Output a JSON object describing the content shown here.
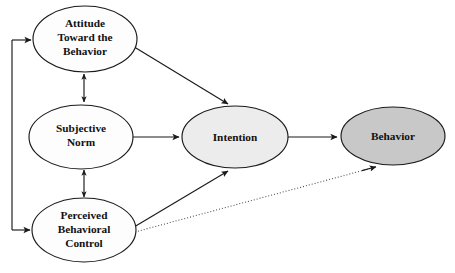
{
  "diagram": {
    "type": "path-diagram",
    "background_color": "#ffffff",
    "stroke_color": "#1a1a1a",
    "nodes": [
      {
        "id": "attitude",
        "label_lines": [
          "Attitude",
          "Toward the",
          "Behavior"
        ],
        "line1": "Attitude",
        "line2": "Toward the",
        "line3": "Behavior",
        "cx": 85,
        "cy": 39,
        "rx": 52,
        "ry": 33,
        "fill": "#fdfdfd"
      },
      {
        "id": "subjective-norm",
        "label_lines": [
          "Subjective",
          "Norm"
        ],
        "line1": "Subjective",
        "line2": "Norm",
        "cx": 81,
        "cy": 137,
        "rx": 52,
        "ry": 32,
        "fill": "#fdfdfd"
      },
      {
        "id": "perceived-behavioral-control",
        "label_lines": [
          "Perceived",
          "Behavioral",
          "Control"
        ],
        "line1": "Perceived",
        "line2": "Behavioral",
        "line3": "Control",
        "cx": 84,
        "cy": 230,
        "rx": 52,
        "ry": 32,
        "fill": "#fdfdfd"
      },
      {
        "id": "intention",
        "label_lines": [
          "Intention"
        ],
        "line1": "Intention",
        "cx": 235,
        "cy": 137,
        "rx": 53,
        "ry": 31,
        "fill": "#ececec"
      },
      {
        "id": "behavior",
        "label_lines": [
          "Behavior"
        ],
        "line1": "Behavior",
        "cx": 393,
        "cy": 136,
        "rx": 52,
        "ry": 29,
        "fill": "#c8c8c8"
      }
    ],
    "edges": [
      {
        "id": "attitude-to-intention",
        "from": "attitude",
        "to": "intention",
        "style": "solid",
        "arrow": "single"
      },
      {
        "id": "norm-to-intention",
        "from": "subjective-norm",
        "to": "intention",
        "style": "solid",
        "arrow": "single"
      },
      {
        "id": "pbc-to-intention",
        "from": "perceived-behavioral-control",
        "to": "intention",
        "style": "solid",
        "arrow": "single"
      },
      {
        "id": "intention-to-behavior",
        "from": "intention",
        "to": "behavior",
        "style": "solid",
        "arrow": "single"
      },
      {
        "id": "pbc-to-behavior",
        "from": "perceived-behavioral-control",
        "to": "behavior",
        "style": "dotted",
        "arrow": "single"
      },
      {
        "id": "attitude-norm-correlation",
        "from": "attitude",
        "to": "subjective-norm",
        "style": "solid",
        "arrow": "double"
      },
      {
        "id": "norm-pbc-correlation",
        "from": "subjective-norm",
        "to": "perceived-behavioral-control",
        "style": "solid",
        "arrow": "double"
      },
      {
        "id": "feedback-rail-to-attitude",
        "from": "rail",
        "to": "attitude",
        "style": "solid",
        "arrow": "single"
      },
      {
        "id": "feedback-rail-to-pbc",
        "from": "rail",
        "to": "perceived-behavioral-control",
        "style": "solid",
        "arrow": "single"
      }
    ]
  },
  "caption": {
    "text": ""
  }
}
